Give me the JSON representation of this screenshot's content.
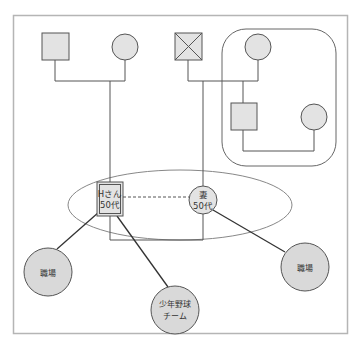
{
  "diagram": {
    "type": "ecomap-genogram",
    "colors": {
      "shape_fill": "#e3e3e3",
      "shape_stroke": "#555555",
      "line": "#555555",
      "connector": "#333333",
      "frame": "#b5b5b5",
      "ellipse": "#888888"
    },
    "members": {
      "paternal_father": {
        "symbol": "square",
        "label": ""
      },
      "paternal_mother": {
        "symbol": "circle",
        "label": ""
      },
      "maternal_father": {
        "symbol": "square-crossed",
        "label": ""
      },
      "maternal_mother": {
        "symbol": "circle",
        "label": ""
      },
      "sibling_male": {
        "symbol": "square",
        "label": ""
      },
      "sibling_spouse": {
        "symbol": "circle",
        "label": ""
      },
      "client": {
        "symbol": "double-square",
        "label_line1": "Hさん",
        "label_line2": "50代"
      },
      "wife": {
        "symbol": "circle",
        "label_line1": "妻",
        "label_line2": "50代"
      }
    },
    "resources": [
      {
        "id": "workplace-client",
        "label": "職場"
      },
      {
        "id": "youth-baseball",
        "label_line1": "少年野球",
        "label_line2": "チーム"
      },
      {
        "id": "workplace-wife",
        "label": "職場"
      }
    ]
  }
}
